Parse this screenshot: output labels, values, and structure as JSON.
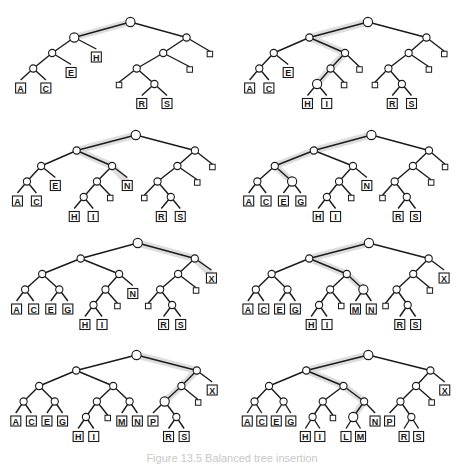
{
  "figure": {
    "caption": "Figure 13.5 Balanced tree insertion",
    "colors": {
      "line": "#1a1a1a",
      "highlight": "#d8d8d8",
      "node_fill": "#ffffff"
    }
  },
  "panels": [
    {
      "name": "panel-1",
      "tree": [
        "*",
        [
          "*",
          [
            "*",
            [
              "*",
              "A",
              "C"
            ],
            "E"
          ],
          "H"
        ],
        [
          "*",
          [
            "*",
            [
              "*",
              "_",
              [
                "*",
                "R",
                "S"
              ]
            ],
            "_"
          ],
          "_"
        ]
      ],
      "highlight": [
        "",
        "L"
      ]
    },
    {
      "name": "panel-2",
      "tree": [
        "*",
        [
          "*",
          [
            "*",
            [
              "*",
              "A",
              "C"
            ],
            "E"
          ],
          [
            "*",
            [
              "*",
              [
                "*",
                "H",
                "I"
              ],
              "_"
            ],
            "_"
          ]
        ],
        [
          "*",
          [
            "*",
            [
              "*",
              "_",
              [
                "*",
                "R",
                "S"
              ]
            ],
            "_"
          ],
          "_"
        ]
      ],
      "highlight": [
        "",
        "L",
        "LR",
        "LRL",
        "LRLL"
      ]
    },
    {
      "name": "panel-3",
      "tree": [
        "*",
        [
          "*",
          [
            "*",
            [
              "*",
              "A",
              "C"
            ],
            "E"
          ],
          [
            "*",
            [
              "*",
              [
                "*",
                "H",
                "I"
              ],
              "_"
            ],
            "N"
          ]
        ],
        [
          "*",
          [
            "*",
            [
              "*",
              "_",
              [
                "*",
                "R",
                "S"
              ]
            ],
            "_"
          ],
          "_"
        ]
      ],
      "highlight": [
        "",
        "L",
        "LR",
        "LRR"
      ]
    },
    {
      "name": "panel-4",
      "tree": [
        "*",
        [
          "*",
          [
            "*",
            [
              "*",
              "A",
              "C"
            ],
            [
              "*",
              "E",
              "G"
            ]
          ],
          [
            "*",
            [
              "*",
              [
                "*",
                "H",
                "I"
              ],
              "_"
            ],
            "N"
          ]
        ],
        [
          "*",
          [
            "*",
            [
              "*",
              "_",
              [
                "*",
                "R",
                "S"
              ]
            ],
            "_"
          ],
          "_"
        ]
      ],
      "highlight": [
        "",
        "L",
        "LL",
        "LLR"
      ]
    },
    {
      "name": "panel-5",
      "tree": [
        "*",
        [
          "*",
          [
            "*",
            [
              "*",
              "A",
              "C"
            ],
            [
              "*",
              "E",
              "G"
            ]
          ],
          [
            "*",
            [
              "*",
              [
                "*",
                "H",
                "I"
              ],
              "_"
            ],
            "N"
          ]
        ],
        [
          "*",
          [
            "*",
            [
              "*",
              "_",
              [
                "*",
                "R",
                "S"
              ]
            ],
            "_"
          ],
          "X"
        ]
      ],
      "highlight": [
        "",
        "R",
        "RR"
      ]
    },
    {
      "name": "panel-6",
      "tree": [
        "*",
        [
          "*",
          [
            "*",
            [
              "*",
              "A",
              "C"
            ],
            [
              "*",
              "E",
              "G"
            ]
          ],
          [
            "*",
            [
              "*",
              [
                "*",
                "H",
                "I"
              ],
              "_"
            ],
            [
              "*",
              "M",
              "N"
            ]
          ]
        ],
        [
          "*",
          [
            "*",
            [
              "*",
              "_",
              [
                "*",
                "R",
                "S"
              ]
            ],
            "_"
          ],
          "X"
        ]
      ],
      "highlight": [
        "",
        "L",
        "LR",
        "LRR"
      ]
    },
    {
      "name": "panel-7",
      "tree": [
        "*",
        [
          "*",
          [
            "*",
            [
              "*",
              "A",
              "C"
            ],
            [
              "*",
              "E",
              "G"
            ]
          ],
          [
            "*",
            [
              "*",
              [
                "*",
                "H",
                "I"
              ],
              "_"
            ],
            [
              "*",
              "M",
              "N"
            ]
          ]
        ],
        [
          "*",
          [
            "*",
            [
              "*",
              "P",
              [
                "*",
                "R",
                "S"
              ]
            ],
            "_"
          ],
          "X"
        ]
      ],
      "highlight": [
        "",
        "R",
        "RL",
        "RLL"
      ]
    },
    {
      "name": "panel-8",
      "tree": [
        "*",
        [
          "*",
          [
            "*",
            [
              "*",
              "A",
              "C"
            ],
            [
              "*",
              "E",
              "G"
            ]
          ],
          [
            "*",
            [
              "*",
              [
                "*",
                "H",
                "I"
              ],
              "_"
            ],
            [
              "*",
              [
                "*",
                "L",
                "M"
              ],
              "N"
            ]
          ]
        ],
        [
          "*",
          [
            "*",
            [
              "*",
              "P",
              [
                "*",
                "R",
                "S"
              ]
            ],
            "_"
          ],
          "X"
        ]
      ],
      "highlight": [
        "",
        "L",
        "LR",
        "LRR",
        "LRRL"
      ]
    }
  ]
}
